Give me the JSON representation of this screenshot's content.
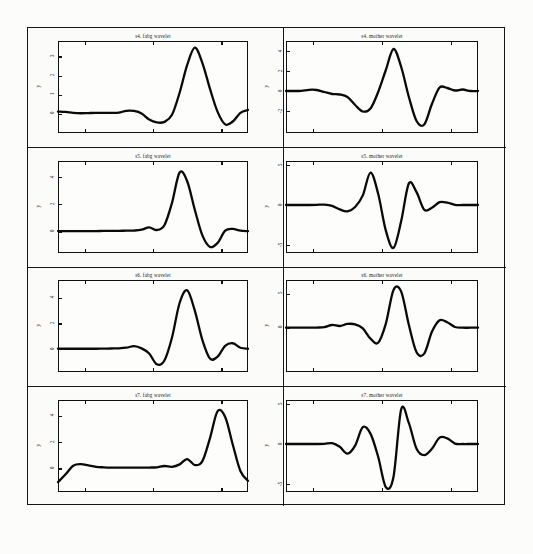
{
  "figure": {
    "background_color": "#fcfcfa",
    "frame_color": "#151515",
    "curve_color": "#0a0a0a",
    "columns": [
      "fabg wavelet",
      "mother wavelet"
    ],
    "rows": [
      "s4",
      "s5",
      "s6",
      "s7"
    ]
  },
  "panels": [
    {
      "id": "s4-fabg",
      "title": "s4. fabg wavelet",
      "ylabel": "y",
      "yticks": [
        "0",
        "1",
        "2",
        "3"
      ],
      "ytick_values": [
        0,
        1,
        2,
        3
      ],
      "column": "left",
      "row": 1
    },
    {
      "id": "s4-mother",
      "title": "s4. mother wavelet",
      "ylabel": "y",
      "yticks": [
        "-2",
        "0",
        "2",
        "4"
      ],
      "ytick_values": [
        -2,
        0,
        2,
        4
      ],
      "column": "right",
      "row": 1
    },
    {
      "id": "s5-fabg",
      "title": "s5. fabg wavelet",
      "ylabel": "y",
      "yticks": [
        "0",
        "2",
        "4"
      ],
      "ytick_values": [
        0,
        2,
        4
      ],
      "column": "left",
      "row": 2
    },
    {
      "id": "s5-mother",
      "title": "s5. mother wavelet",
      "ylabel": "y",
      "yticks": [
        "-5",
        "0",
        "5"
      ],
      "ytick_values": [
        -5,
        0,
        5
      ],
      "column": "right",
      "row": 2
    },
    {
      "id": "s6-fabg",
      "title": "s6. fabg wavelet",
      "ylabel": "y",
      "yticks": [
        "0",
        "2",
        "4"
      ],
      "ytick_values": [
        0,
        2,
        4
      ],
      "column": "left",
      "row": 3
    },
    {
      "id": "s6-mother",
      "title": "s6. mother wavelet",
      "ylabel": "y",
      "yticks": [
        "0",
        "5"
      ],
      "ytick_values": [
        0,
        5
      ],
      "column": "right",
      "row": 3
    },
    {
      "id": "s7-fabg",
      "title": "s7. fabg wavelet",
      "ylabel": "y",
      "yticks": [
        "0",
        "2",
        "4"
      ],
      "ytick_values": [
        0,
        2,
        4
      ],
      "column": "left",
      "row": 4
    },
    {
      "id": "s7-mother",
      "title": "s7. mother wavelet",
      "ylabel": "y",
      "yticks": [
        "-5",
        "0",
        "5"
      ],
      "ytick_values": [
        -5,
        0,
        5
      ],
      "column": "right",
      "row": 4
    }
  ],
  "chart_data": [
    {
      "type": "line",
      "title": "s4. fabg wavelet",
      "xlabel": "",
      "ylabel": "y",
      "ylim": [
        -1.0,
        3.8
      ],
      "xlim": [
        0,
        1
      ],
      "grid": false,
      "yticks": [
        0,
        1,
        2,
        3
      ],
      "series": [
        {
          "name": "s4 fabg",
          "x": [
            0.0,
            0.04,
            0.08,
            0.12,
            0.16,
            0.2,
            0.24,
            0.28,
            0.32,
            0.36,
            0.4,
            0.44,
            0.48,
            0.52,
            0.56,
            0.6,
            0.64,
            0.68,
            0.72,
            0.76,
            0.8,
            0.84,
            0.88,
            0.92,
            0.96,
            1.0
          ],
          "y": [
            0.12,
            0.1,
            0.05,
            0.03,
            0.04,
            0.05,
            0.05,
            0.05,
            0.06,
            0.16,
            0.15,
            0.02,
            -0.3,
            -0.45,
            -0.42,
            -0.05,
            1.1,
            2.55,
            3.45,
            2.65,
            1.3,
            0.1,
            -0.55,
            -0.4,
            0.05,
            0.2
          ]
        }
      ]
    },
    {
      "type": "line",
      "title": "s4. mother wavelet",
      "xlabel": "",
      "ylabel": "y",
      "ylim": [
        -4.2,
        5.0
      ],
      "xlim": [
        0,
        1
      ],
      "grid": false,
      "yticks": [
        -2,
        0,
        2,
        4
      ],
      "series": [
        {
          "name": "s4 mother",
          "x": [
            0.0,
            0.04,
            0.08,
            0.12,
            0.16,
            0.2,
            0.24,
            0.28,
            0.32,
            0.36,
            0.4,
            0.44,
            0.48,
            0.52,
            0.56,
            0.6,
            0.64,
            0.68,
            0.72,
            0.76,
            0.8,
            0.84,
            0.88,
            0.92,
            0.96,
            1.0
          ],
          "y": [
            0.0,
            0.0,
            0.02,
            0.12,
            0.1,
            -0.1,
            -0.3,
            -0.35,
            -0.6,
            -1.4,
            -2.05,
            -1.75,
            -0.1,
            2.1,
            4.2,
            2.4,
            -0.6,
            -3.0,
            -3.35,
            -1.3,
            0.35,
            0.3,
            0.05,
            0.15,
            0.0,
            0.0
          ]
        }
      ]
    },
    {
      "type": "line",
      "title": "s5. fabg wavelet",
      "xlabel": "",
      "ylabel": "y",
      "ylim": [
        -1.6,
        5.2
      ],
      "xlim": [
        0,
        1
      ],
      "grid": false,
      "yticks": [
        0,
        2,
        4
      ],
      "series": [
        {
          "name": "s5 fabg",
          "x": [
            0.0,
            0.04,
            0.08,
            0.12,
            0.16,
            0.2,
            0.24,
            0.28,
            0.32,
            0.36,
            0.4,
            0.44,
            0.48,
            0.52,
            0.56,
            0.6,
            0.64,
            0.68,
            0.72,
            0.76,
            0.8,
            0.84,
            0.88,
            0.92,
            0.96,
            1.0
          ],
          "y": [
            0.02,
            0.02,
            0.02,
            0.02,
            0.02,
            0.02,
            0.03,
            0.03,
            0.04,
            0.05,
            0.06,
            0.12,
            0.3,
            0.1,
            0.45,
            2.1,
            4.35,
            3.7,
            1.6,
            -0.3,
            -1.15,
            -0.85,
            0.05,
            0.18,
            0.05,
            0.02
          ]
        }
      ]
    },
    {
      "type": "line",
      "title": "s5. mother wavelet",
      "xlabel": "",
      "ylabel": "y",
      "ylim": [
        -6.0,
        5.5
      ],
      "xlim": [
        0,
        1
      ],
      "grid": false,
      "yticks": [
        -5,
        0,
        5
      ],
      "series": [
        {
          "name": "s5 mother",
          "x": [
            0.0,
            0.04,
            0.08,
            0.12,
            0.16,
            0.2,
            0.24,
            0.28,
            0.32,
            0.36,
            0.4,
            0.44,
            0.48,
            0.52,
            0.56,
            0.6,
            0.64,
            0.68,
            0.72,
            0.76,
            0.8,
            0.84,
            0.88,
            0.92,
            0.96,
            1.0
          ],
          "y": [
            0.0,
            0.0,
            0.0,
            0.0,
            0.02,
            0.05,
            -0.1,
            -0.55,
            -0.8,
            -0.25,
            1.2,
            4.05,
            1.4,
            -3.2,
            -5.35,
            -2.0,
            2.7,
            1.6,
            -0.6,
            -0.35,
            0.35,
            0.3,
            0.02,
            0.0,
            0.0,
            0.0
          ]
        }
      ]
    },
    {
      "type": "line",
      "title": "s6. fabg wavelet",
      "xlabel": "",
      "ylabel": "y",
      "ylim": [
        -1.8,
        5.4
      ],
      "xlim": [
        0,
        1
      ],
      "grid": false,
      "yticks": [
        0,
        2,
        4
      ],
      "series": [
        {
          "name": "s6 fabg",
          "x": [
            0.0,
            0.04,
            0.08,
            0.12,
            0.16,
            0.2,
            0.24,
            0.28,
            0.32,
            0.36,
            0.4,
            0.44,
            0.48,
            0.52,
            0.56,
            0.6,
            0.64,
            0.68,
            0.72,
            0.76,
            0.8,
            0.84,
            0.88,
            0.92,
            0.96,
            1.0
          ],
          "y": [
            0.02,
            0.02,
            0.02,
            0.02,
            0.02,
            0.02,
            0.03,
            0.04,
            0.05,
            0.1,
            0.22,
            0.05,
            -0.35,
            -1.2,
            -0.9,
            0.9,
            3.6,
            4.6,
            3.0,
            0.7,
            -0.75,
            -0.6,
            0.25,
            0.45,
            0.1,
            0.02
          ]
        }
      ]
    },
    {
      "type": "line",
      "title": "s6. mother wavelet",
      "xlabel": "",
      "ylabel": "y",
      "ylim": [
        -6.5,
        7.0
      ],
      "xlim": [
        0,
        1
      ],
      "grid": false,
      "yticks": [
        0,
        5
      ],
      "series": [
        {
          "name": "s6 mother",
          "x": [
            0.0,
            0.04,
            0.08,
            0.12,
            0.16,
            0.2,
            0.24,
            0.28,
            0.32,
            0.36,
            0.4,
            0.44,
            0.48,
            0.52,
            0.56,
            0.6,
            0.64,
            0.68,
            0.72,
            0.76,
            0.8,
            0.84,
            0.88,
            0.92,
            0.96,
            1.0
          ],
          "y": [
            0.0,
            0.0,
            0.0,
            0.0,
            0.02,
            0.1,
            0.4,
            0.25,
            0.55,
            0.5,
            -0.1,
            -1.6,
            -2.2,
            0.6,
            5.55,
            5.3,
            0.4,
            -3.6,
            -3.8,
            -0.6,
            1.1,
            0.8,
            0.1,
            0.0,
            0.0,
            0.0
          ]
        }
      ]
    },
    {
      "type": "line",
      "title": "s7. fabg wavelet",
      "xlabel": "",
      "ylabel": "y",
      "ylim": [
        -1.8,
        5.2
      ],
      "xlim": [
        0,
        1
      ],
      "grid": false,
      "yticks": [
        0,
        2,
        4
      ],
      "series": [
        {
          "name": "s7 fabg",
          "x": [
            0.0,
            0.04,
            0.08,
            0.12,
            0.16,
            0.2,
            0.24,
            0.28,
            0.32,
            0.36,
            0.4,
            0.44,
            0.48,
            0.52,
            0.56,
            0.6,
            0.64,
            0.68,
            0.72,
            0.76,
            0.8,
            0.84,
            0.88,
            0.92,
            0.96,
            1.0
          ],
          "y": [
            -1.05,
            -0.45,
            0.2,
            0.32,
            0.22,
            0.12,
            0.08,
            0.06,
            0.06,
            0.05,
            0.05,
            0.05,
            0.06,
            0.08,
            0.18,
            0.12,
            0.3,
            0.7,
            0.25,
            0.55,
            2.3,
            4.35,
            3.9,
            1.8,
            -0.2,
            -0.95
          ]
        }
      ]
    },
    {
      "type": "line",
      "title": "s7. mother wavelet",
      "xlabel": "",
      "ylabel": "y",
      "ylim": [
        -6.0,
        5.5
      ],
      "xlim": [
        0,
        1
      ],
      "grid": false,
      "yticks": [
        -5,
        0,
        5
      ],
      "series": [
        {
          "name": "s7 mother",
          "x": [
            0.0,
            0.04,
            0.08,
            0.12,
            0.16,
            0.2,
            0.24,
            0.28,
            0.32,
            0.36,
            0.4,
            0.44,
            0.48,
            0.52,
            0.56,
            0.6,
            0.64,
            0.68,
            0.72,
            0.76,
            0.8,
            0.84,
            0.88,
            0.92,
            0.96,
            1.0
          ],
          "y": [
            0.0,
            0.0,
            0.0,
            0.0,
            0.0,
            0.02,
            0.1,
            -0.35,
            -1.2,
            -0.2,
            2.1,
            1.3,
            -1.6,
            -5.4,
            -4.1,
            4.35,
            2.6,
            -0.6,
            -1.4,
            -0.6,
            0.8,
            0.7,
            0.05,
            0.0,
            0.0,
            0.0
          ]
        }
      ]
    }
  ]
}
